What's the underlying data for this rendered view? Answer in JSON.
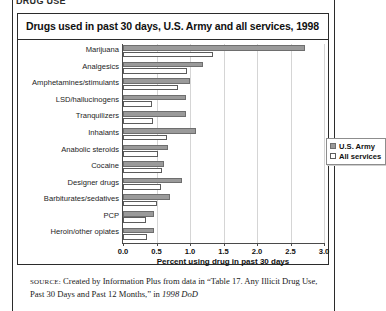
{
  "page": {
    "top_partial_text": "DRUG USE",
    "source_note": {
      "label": "SOURCE:",
      "text_before_quote": " Created by Information Plus from data in “Table 17. Any Illicit Drug Use, Past 30 Days and Past 12 Months,” in ",
      "italic_tail": "1998 DoD"
    }
  },
  "figure": {
    "title": "Drugs used in past 30 days, U.S. Army and all services, 1998",
    "legend": {
      "position": "inside-right",
      "entries": [
        {
          "label": "U.S. Army",
          "swatch": "filled-gray-square",
          "color": "#9a9a9a"
        },
        {
          "label": "All services",
          "swatch": "empty-white-square",
          "color": "#ffffff"
        }
      ]
    }
  },
  "chart_data": {
    "type": "bar",
    "orientation": "horizontal",
    "title": "Drugs used in past 30 days, U.S. Army and all services, 1998",
    "xlabel": "Percent using drug in past 30 days",
    "ylabel": "",
    "xlim": [
      0.0,
      3.0
    ],
    "xticks": [
      0.0,
      0.5,
      1.0,
      1.5,
      2.0,
      2.5,
      3.0
    ],
    "xtick_labels": [
      "0.0",
      "0.5",
      "1.0",
      "1.5",
      "2.0",
      "2.5",
      "3.0"
    ],
    "grid": "vertical-only",
    "legend_position": "upper right inside axes",
    "categories": [
      "Marijuana",
      "Analgesics",
      "Amphetamines/stimulants",
      "LSD/hallucinogens",
      "Tranquilizers",
      "Inhalants",
      "Anabolic steroids",
      "Cocaine",
      "Designer drugs",
      "Barbiturates/sedatives",
      "PCP",
      "Heroin/other opiates"
    ],
    "series": [
      {
        "name": "U.S. Army",
        "color": "#9a9a9a",
        "values": [
          2.72,
          1.2,
          1.0,
          0.94,
          0.94,
          1.09,
          0.67,
          0.61,
          0.88,
          0.7,
          0.46,
          0.46
        ]
      },
      {
        "name": "All services",
        "color": "#ffffff",
        "values": [
          1.34,
          0.95,
          0.82,
          0.43,
          0.45,
          0.66,
          0.52,
          0.58,
          0.57,
          0.51,
          0.34,
          0.36
        ]
      }
    ]
  }
}
